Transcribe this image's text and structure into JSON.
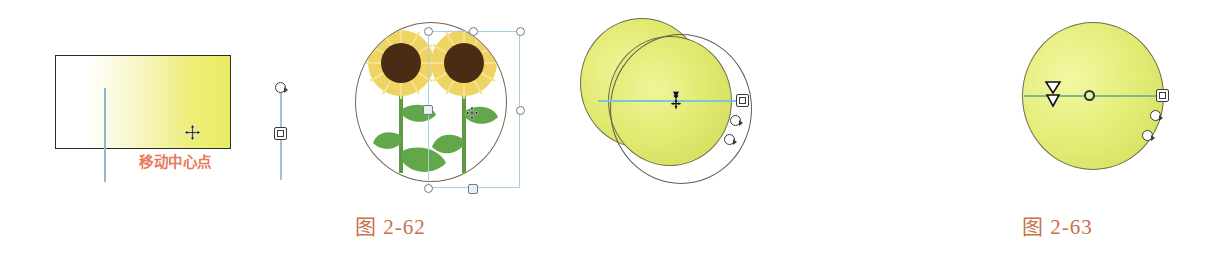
{
  "page": {
    "background_color": "#ffffff",
    "width": 1207,
    "height": 257
  },
  "annotations": {
    "move_center_label": "移动中心点",
    "move_center_color": "#e8795a"
  },
  "figures": [
    {
      "id": "fig-2-62",
      "caption": "图 2-62",
      "caption_color": "#c8714c",
      "parts": [
        {
          "name": "gradient-rectangle",
          "description": "矩形渐变填充",
          "gradient_from": "#ffffff",
          "gradient_to": "#e8ec63",
          "border_color": "#2b2b2b"
        },
        {
          "name": "sunflower-circle",
          "description": "向日葵圆形裁剪图",
          "fill_color": "#ffffff",
          "border_color": "#6e6257"
        },
        {
          "name": "selection-bounding-box",
          "description": "选择框",
          "border_color": "#a9cfe4"
        }
      ]
    },
    {
      "id": "fig-2-63",
      "caption": "图 2-63",
      "caption_color": "#c8714c",
      "parts": [
        {
          "name": "yellow-disc",
          "description": "黄绿色圆形渐变",
          "fill_color": "#e5ed78",
          "border_color": "#6d6a4a"
        },
        {
          "name": "center-axis",
          "description": "中心轴线",
          "color": "#6fbf8f"
        }
      ]
    }
  ],
  "handles": {
    "rotate_handle": "rotate-handle",
    "move_square_handle": "move-square-handle",
    "center_point": "center-point",
    "move_cursor": "move-cursor"
  },
  "colors": {
    "axis_blue": "#8fb7d4",
    "axis_cyan": "#7fc4d8",
    "axis_green": "#6fbf8f",
    "handle_outline": "#3b3b3b",
    "selection_blue": "#a9cfe4",
    "yellow_fill": "#e5ed78",
    "sunflower_center": "#4a2b14",
    "sunflower_petal": "#f0d463",
    "stem_green": "#5c9a43"
  }
}
